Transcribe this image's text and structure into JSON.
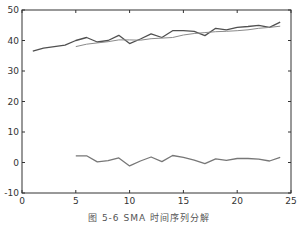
{
  "figure": {
    "caption": "图 5-6  SMA 时间序列分解"
  },
  "chart_data": {
    "type": "line",
    "title": "",
    "xlabel": "",
    "ylabel": "",
    "xlim": [
      0,
      25
    ],
    "ylim": [
      -10,
      50
    ],
    "xticks": [
      0,
      5,
      10,
      15,
      20,
      25
    ],
    "yticks": [
      -10,
      0,
      10,
      20,
      30,
      40,
      50
    ],
    "grid": false,
    "legend": null,
    "series": [
      {
        "name": "original",
        "color": "#505050",
        "x": [
          1,
          2,
          3,
          4,
          5,
          6,
          7,
          8,
          9,
          10,
          11,
          12,
          13,
          14,
          15,
          16,
          17,
          18,
          19,
          20,
          21,
          22,
          23,
          24
        ],
        "values": [
          36.5,
          37.5,
          38,
          38.5,
          40,
          41,
          39.5,
          40,
          41.7,
          39,
          40.5,
          42.2,
          41,
          43.2,
          43.2,
          43,
          41.6,
          44,
          43.5,
          44.3,
          44.6,
          45,
          44.3,
          46
        ]
      },
      {
        "name": "trend (SMA)",
        "color": "#8a8a8a",
        "x": [
          5,
          6,
          7,
          8,
          9,
          10,
          11,
          12,
          13,
          14,
          15,
          16,
          17,
          18,
          19,
          20,
          21,
          22,
          23,
          24
        ],
        "values": [
          38,
          38.8,
          39.2,
          39.6,
          40.2,
          40.2,
          40.1,
          40.6,
          40.8,
          41,
          41.8,
          42.3,
          42.6,
          42.9,
          43,
          43.2,
          43.5,
          44,
          44.3,
          44.7
        ]
      },
      {
        "name": "residual",
        "color": "#777777",
        "x": [
          5,
          6,
          7,
          8,
          9,
          10,
          11,
          12,
          13,
          14,
          15,
          16,
          17,
          18,
          19,
          20,
          21,
          22,
          23,
          24
        ],
        "values": [
          2.2,
          2.2,
          0.2,
          0.6,
          1.5,
          -1.1,
          0.5,
          1.8,
          0.3,
          2.3,
          1.7,
          0.8,
          -0.4,
          1.2,
          0.7,
          1.3,
          1.3,
          1.1,
          0.5,
          1.7
        ]
      }
    ]
  }
}
